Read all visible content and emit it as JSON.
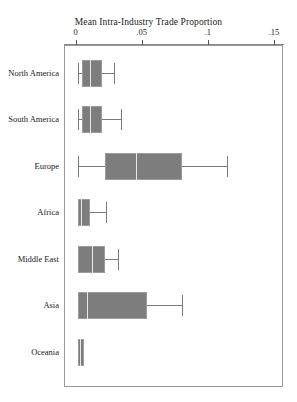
{
  "chart_data": {
    "type": "box",
    "title": "Mean Intra-Industry Trade Proportion",
    "xlabel": "",
    "ylabel": "",
    "xlim": [
      0,
      0.15
    ],
    "grid": false,
    "legend": "none",
    "orientation": "horizontal",
    "xtick_labels": [
      "0",
      ".05",
      ".1",
      ".15"
    ],
    "xtick_values": [
      0,
      0.05,
      0.1,
      0.15
    ],
    "categories": [
      "North America",
      "South America",
      "Europe",
      "Africa",
      "Middle East",
      "Asia",
      "Oceania"
    ],
    "boxes": [
      {
        "category": "North America",
        "whisker_low": 0.0015,
        "q1": 0.004,
        "median": 0.01,
        "q3": 0.0195,
        "whisker_high": 0.0285
      },
      {
        "category": "South America",
        "whisker_low": 0.001,
        "q1": 0.004,
        "median": 0.0105,
        "q3": 0.0195,
        "whisker_high": 0.0335
      },
      {
        "category": "Europe",
        "whisker_low": 0.0013,
        "q1": 0.0212,
        "median": 0.0447,
        "q3": 0.0795,
        "whisker_high": 0.1136
      },
      {
        "category": "Africa",
        "whisker_low": 0.0008,
        "q1": 0.0008,
        "median": 0.0034,
        "q3": 0.0099,
        "whisker_high": 0.022
      },
      {
        "category": "Middle East",
        "whisker_low": 0.0013,
        "q1": 0.0015,
        "median": 0.0114,
        "q3": 0.0212,
        "whisker_high": 0.0311
      },
      {
        "category": "Asia",
        "whisker_low": 0.0008,
        "q1": 0.0008,
        "median": 0.0076,
        "q3": 0.053,
        "whisker_high": 0.0795
      },
      {
        "category": "Oceania",
        "whisker_low": 0.0008,
        "q1": 0.0008,
        "median": 0.0023,
        "q3": 0.0053,
        "whisker_high": 0.0053
      }
    ]
  }
}
